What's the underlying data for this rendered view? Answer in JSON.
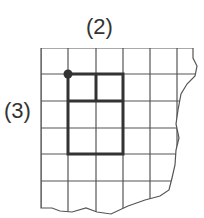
{
  "diagram": {
    "type": "grid-figure",
    "labels": {
      "top": "(2)",
      "side": "(3)"
    },
    "grid": {
      "columns_visible": 6,
      "rows_visible": 6,
      "cell_size_px": 27,
      "right_edge": "torn",
      "bottom_edge": "torn"
    },
    "highlighted_rectangle": {
      "width_cells": 2,
      "height_cells": 3,
      "start_cell": {
        "col": 1,
        "row": 1
      },
      "inner_divisions": "top cell row split vertically into 2 squares",
      "corner_dot": "top-left"
    },
    "colors": {
      "grid_line": "#555555",
      "highlight_line": "#333333",
      "text": "#333333",
      "background": "#ffffff"
    }
  }
}
